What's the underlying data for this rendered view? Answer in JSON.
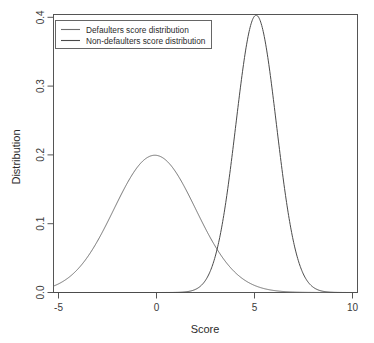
{
  "chart_data": {
    "type": "line",
    "title": "",
    "subtitle": "",
    "xlabel": "Score",
    "ylabel": "Distribution",
    "xlim": [
      -5,
      10
    ],
    "ylim": [
      0.0,
      0.4
    ],
    "grid": false,
    "legend_position": "top-left",
    "x_ticks": [
      "-5",
      "0",
      "5",
      "10"
    ],
    "x_tick_values": [
      -5,
      0,
      5,
      10
    ],
    "y_ticks": [
      "0.0",
      "0.1",
      "0.2",
      "0.3",
      "0.4"
    ],
    "y_tick_values": [
      0.0,
      0.1,
      0.2,
      0.3,
      0.4
    ],
    "series": [
      {
        "name": "Defaulters score distribution",
        "color": "#6e6e6e",
        "distribution": "normal",
        "mean": 0,
        "sigma": 2.02,
        "peak_value": 0.197,
        "peak_x": 0,
        "x": [
          -5,
          -4.5,
          -4,
          -3.5,
          -3,
          -2.5,
          -2,
          -1.5,
          -1,
          -0.5,
          0,
          0.5,
          1,
          1.5,
          2,
          2.5,
          3,
          3.5,
          4,
          4.5,
          5,
          5.5,
          6,
          6.5,
          7,
          7.5,
          8,
          8.5,
          9,
          9.5,
          10
        ],
        "values": [
          0.0105,
          0.0191,
          0.0318,
          0.0486,
          0.0679,
          0.0871,
          0.1025,
          0.1107,
          0.1099,
          0.1008,
          0.0986,
          0.1008,
          0.1099,
          0.1107,
          0.1025,
          0.0871,
          0.0679,
          0.0486,
          0.0318,
          0.0191,
          0.0105,
          0.0053,
          0.0025,
          0.0011,
          0.0004,
          0.0001,
          0.0001,
          0.0,
          0.0,
          0.0,
          0.0
        ]
      },
      {
        "name": "Non-defaulters score distribution",
        "color": "#4a4a4a",
        "distribution": "normal",
        "mean": 5,
        "sigma": 1.0,
        "peak_value": 0.399,
        "peak_x": 5,
        "x": [
          -5,
          -4,
          -3,
          -2,
          -1,
          0,
          1,
          2,
          3,
          3.5,
          4,
          4.5,
          5,
          5.5,
          6,
          6.5,
          7,
          7.5,
          8,
          9,
          10
        ],
        "values": [
          0.0,
          0.0,
          0.0,
          0.0,
          0.0,
          0.0,
          0.0001,
          0.0044,
          0.054,
          0.1295,
          0.242,
          0.3521,
          0.3989,
          0.3521,
          0.242,
          0.1295,
          0.054,
          0.0175,
          0.0044,
          0.0001,
          0.0
        ]
      }
    ]
  },
  "legend": {
    "items": [
      {
        "label": "Defaulters score distribution"
      },
      {
        "label": "Non-defaulters score distribution"
      }
    ]
  },
  "axes": {
    "x_title": "Score",
    "y_title": "Distribution",
    "x_tick_labels": [
      "-5",
      "0",
      "5",
      "10"
    ],
    "y_tick_labels": [
      "0.0",
      "0.1",
      "0.2",
      "0.3",
      "0.4"
    ]
  },
  "colors": {
    "background": "#ffffff",
    "frame": "#555555",
    "text": "#2b2b2b",
    "series_1": "#6e6e6e",
    "series_2": "#4a4a4a"
  }
}
